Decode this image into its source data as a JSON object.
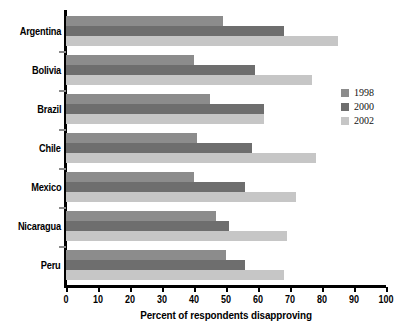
{
  "chart_data": {
    "type": "bar",
    "orientation": "horizontal",
    "title": "",
    "subtitle": "",
    "xlabel": "Percent of respondents disapproving",
    "ylabel": "",
    "xlim": [
      0,
      100
    ],
    "xticks": [
      0,
      10,
      20,
      30,
      40,
      50,
      60,
      70,
      80,
      90,
      100
    ],
    "grid": false,
    "legend_position": "right",
    "categories": [
      "Argentina",
      "Bolivia",
      "Brazil",
      "Chile",
      "Mexico",
      "Nicaragua",
      "Peru"
    ],
    "series": [
      {
        "name": "1998",
        "color": "#8c8c8c",
        "values": [
          49,
          40,
          45,
          41,
          40,
          47,
          50
        ]
      },
      {
        "name": "2000",
        "color": "#6e6e6e",
        "values": [
          68,
          59,
          62,
          58,
          56,
          51,
          56
        ]
      },
      {
        "name": "2002",
        "color": "#c6c6c6",
        "values": [
          85,
          77,
          62,
          78,
          72,
          69,
          68
        ]
      }
    ]
  },
  "axis": {
    "x_title": "Percent of respondents disapproving",
    "tick_labels": [
      "0",
      "10",
      "20",
      "30",
      "40",
      "50",
      "60",
      "70",
      "80",
      "90",
      "100"
    ]
  },
  "categories": [
    {
      "label": "Argentina"
    },
    {
      "label": "Bolivia"
    },
    {
      "label": "Brazil"
    },
    {
      "label": "Chile"
    },
    {
      "label": "Mexico"
    },
    {
      "label": "Nicaragua"
    },
    {
      "label": "Peru"
    }
  ],
  "legend": {
    "items": [
      {
        "label": "1998",
        "color": "#8c8c8c"
      },
      {
        "label": "2000",
        "color": "#6e6e6e"
      },
      {
        "label": "2002",
        "color": "#c6c6c6"
      }
    ]
  }
}
